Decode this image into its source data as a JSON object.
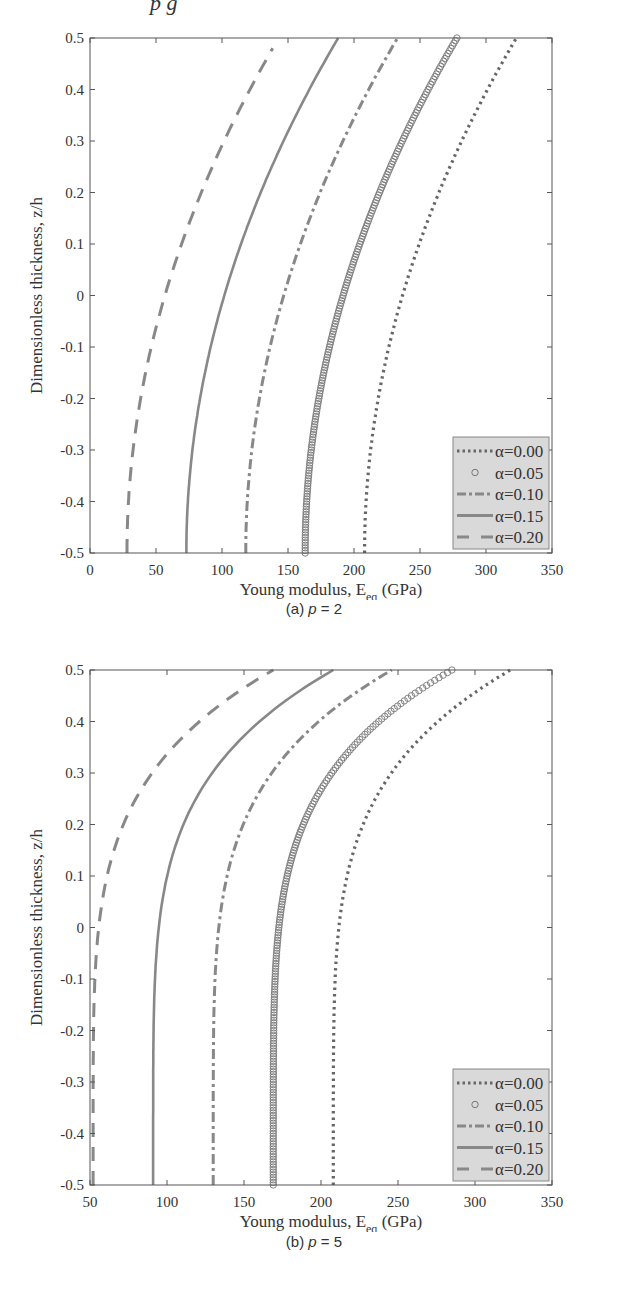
{
  "page": {
    "top_fragment": "p g"
  },
  "chart_data": [
    {
      "type": "line",
      "id": "a",
      "caption_prefix": "(a) ",
      "caption_var": "p",
      "caption_suffix": " = 2",
      "p": 2,
      "xlabel": "Young modulus, E",
      "xlabel_sub": "eq",
      "xlabel_unit": " (GPa)",
      "ylabel": "Dimensionless thickness, z/h",
      "xlim": [
        0,
        350
      ],
      "ylim": [
        -0.5,
        0.5
      ],
      "xticks": [
        0,
        50,
        100,
        150,
        200,
        250,
        300,
        350
      ],
      "yticks": [
        -0.5,
        -0.4,
        -0.3,
        -0.2,
        -0.1,
        0,
        0.1,
        0.2,
        0.3,
        0.4,
        0.5
      ],
      "legend_position": "lower right",
      "grid": false,
      "series": [
        {
          "name": "α=0.00",
          "style": "dotted",
          "E_bottom": 208,
          "E_top": 323,
          "z_max": 0.5
        },
        {
          "name": "α=0.05",
          "style": "circles",
          "E_bottom": 163,
          "E_top": 278,
          "z_max": 0.5
        },
        {
          "name": "α=0.10",
          "style": "dashdot",
          "E_bottom": 118,
          "E_top": 233,
          "z_max": 0.5
        },
        {
          "name": "α=0.15",
          "style": "solid",
          "E_bottom": 73,
          "E_top": 188,
          "z_max": 0.5
        },
        {
          "name": "α=0.20",
          "style": "dashed",
          "E_bottom": 28,
          "E_top": 143,
          "z_max": 0.48
        }
      ]
    },
    {
      "type": "line",
      "id": "b",
      "caption_prefix": "(b) ",
      "caption_var": "p",
      "caption_suffix": " = 5",
      "p": 5,
      "xlabel": "Young modulus, E",
      "xlabel_sub": "eq",
      "xlabel_unit": " (GPa)",
      "ylabel": "Dimensionless thickness, z/h",
      "xlim": [
        50,
        350
      ],
      "ylim": [
        -0.5,
        0.5
      ],
      "xticks": [
        50,
        100,
        150,
        200,
        250,
        300,
        350
      ],
      "yticks": [
        -0.5,
        -0.4,
        -0.3,
        -0.2,
        -0.1,
        0,
        0.1,
        0.2,
        0.3,
        0.4,
        0.5
      ],
      "legend_position": "lower right",
      "grid": false,
      "series": [
        {
          "name": "α=0.00",
          "style": "dotted",
          "E_bottom": 208,
          "E_top": 323,
          "z_max": 0.5
        },
        {
          "name": "α=0.05",
          "style": "circles",
          "E_bottom": 169,
          "E_top": 285,
          "z_max": 0.5
        },
        {
          "name": "α=0.10",
          "style": "dashdot",
          "E_bottom": 130,
          "E_top": 246,
          "z_max": 0.5
        },
        {
          "name": "α=0.15",
          "style": "solid",
          "E_bottom": 91,
          "E_top": 208,
          "z_max": 0.5
        },
        {
          "name": "α=0.20",
          "style": "dashed",
          "E_bottom": 52,
          "E_top": 169,
          "z_max": 0.5
        }
      ]
    }
  ],
  "colors": {
    "axis": "#555555",
    "curve": "#888888",
    "dotted": "#666666",
    "circles": "#777777",
    "legend_bg": "#d9d9d9",
    "legend_border": "#888888"
  }
}
